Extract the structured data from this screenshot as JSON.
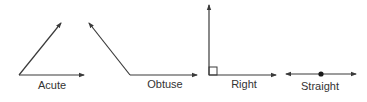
{
  "diagram": {
    "type": "angle-types",
    "stroke_color": "#3a3a3a",
    "angles": [
      {
        "name": "Acute",
        "label": "Acute"
      },
      {
        "name": "Obtuse",
        "label": "Obtuse"
      },
      {
        "name": "Right",
        "label": "Right"
      },
      {
        "name": "Straight",
        "label": "Straight"
      }
    ]
  }
}
